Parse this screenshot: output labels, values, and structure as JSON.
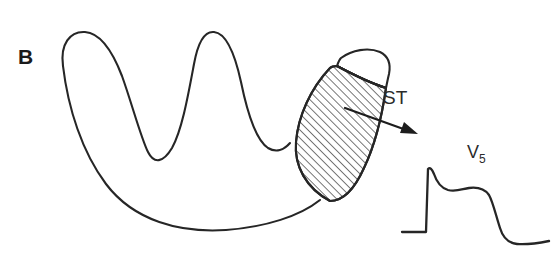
{
  "figure": {
    "panel_label": "B",
    "background_color": "#ffffff",
    "stroke_color": "#262626",
    "width": 557,
    "height": 254
  },
  "annotations": {
    "st_label": "ST",
    "lead_label": "V",
    "lead_subscript": "5"
  },
  "diagram": {
    "myocardium_name": "left-ventricle-cross-section",
    "infarct_region_name": "st-elevation-zone",
    "hatch_angle_degrees": 45,
    "hatch_spacing_px": 4
  },
  "ecg": {
    "lead": "V5",
    "baseline_y": 232,
    "r_peak_y": 167,
    "description_points": [
      [
        402,
        232
      ],
      [
        427,
        232
      ],
      [
        427,
        168
      ],
      [
        433,
        173
      ],
      [
        441,
        186
      ],
      [
        452,
        190
      ],
      [
        466,
        188
      ],
      [
        480,
        187
      ],
      [
        489,
        193
      ],
      [
        495,
        212
      ],
      [
        500,
        232
      ],
      [
        506,
        241
      ],
      [
        516,
        244
      ],
      [
        532,
        243
      ],
      [
        548,
        241
      ]
    ]
  }
}
